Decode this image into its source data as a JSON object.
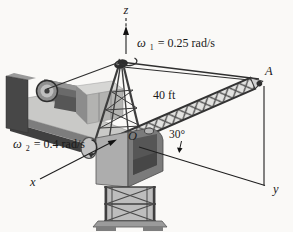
{
  "figure_title": "Rotating tower crane with boom OA",
  "labels": {
    "z_axis": "z",
    "x_axis": "x",
    "y_axis": "y",
    "origin": "O",
    "point_a": "A",
    "boom_length": "40 ft",
    "boom_angle": "30°",
    "omega1": {
      "symbol": "ω",
      "subscript": "1",
      "value": " = 0.25 rad/s"
    },
    "omega2": {
      "symbol": "ω",
      "subscript": "2",
      "value": " = 0.4 rad/s"
    }
  },
  "values": {
    "omega1_rad_per_s": 0.25,
    "omega2_rad_per_s": 0.4,
    "boom_length_ft": 40,
    "boom_elevation_deg": 30
  },
  "colors": {
    "background": "#faf9f7",
    "line_ink": "#1f1f1f",
    "structure_dark": "#3f3f3f",
    "structure_mid": "#8c8c8c",
    "structure_light": "#c9c9c7"
  }
}
